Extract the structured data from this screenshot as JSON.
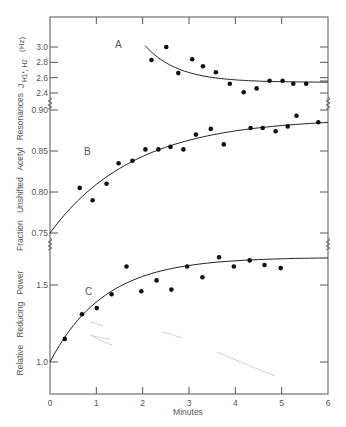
{
  "chart_data": [
    {
      "panel": "A",
      "type": "scatter",
      "title": "",
      "panel_label": "A",
      "xlabel": "Minutes",
      "ylabel": "J H1*,H2 (Hz)",
      "ylabel_parts": {
        "main": "J",
        "sub": "H1*, H2",
        "unit": "(Hz)"
      },
      "yticks": [
        3.0,
        2.8,
        2.6,
        2.4
      ],
      "ytick_labels": [
        "3.0",
        "2.8",
        "2.6",
        "2.4"
      ],
      "ylim": [
        2.3,
        3.2
      ],
      "x": [
        2.19,
        2.51,
        2.77,
        3.07,
        3.3,
        3.58,
        3.88,
        4.18,
        4.46,
        4.74,
        5.02,
        5.25,
        5.53
      ],
      "y": [
        2.83,
        3.0,
        2.66,
        2.84,
        2.75,
        2.67,
        2.52,
        2.41,
        2.46,
        2.56,
        2.56,
        2.52,
        2.52
      ],
      "fit_curve": {
        "type": "exponential-decay",
        "x_start": 2.05,
        "x_end": 6.0,
        "y_start": 3.02,
        "y_asymptote": 2.54
      }
    },
    {
      "panel": "B",
      "type": "scatter",
      "panel_label": "B",
      "xlabel": "Minutes",
      "ylabel": "Fraction Unshifted Acetyl Resonances",
      "yticks": [
        0.9,
        0.85,
        0.8,
        0.75
      ],
      "ytick_labels": [
        "0.90",
        "0.85",
        "0.80",
        "0.75"
      ],
      "ylim": [
        0.73,
        0.9
      ],
      "x": [
        0.64,
        0.92,
        1.22,
        1.48,
        1.78,
        2.06,
        2.34,
        2.6,
        2.88,
        3.15,
        3.47,
        3.75,
        4.33,
        4.59,
        4.87,
        5.13,
        5.32,
        5.79
      ],
      "y": [
        0.805,
        0.79,
        0.81,
        0.835,
        0.838,
        0.852,
        0.852,
        0.855,
        0.852,
        0.87,
        0.877,
        0.858,
        0.878,
        0.878,
        0.874,
        0.88,
        0.893,
        0.885
      ],
      "fit_curve": {
        "type": "exponential-rise",
        "x_start": 0.0,
        "x_end": 6.0,
        "y_start": 0.75,
        "y_asymptote": 0.89
      }
    },
    {
      "panel": "C",
      "type": "scatter",
      "panel_label": "C",
      "xlabel": "Minutes",
      "ylabel": "Relative Reducing Power",
      "yticks": [
        1.5,
        1.0
      ],
      "ytick_labels": [
        "1.5",
        "1.0"
      ],
      "ylim": [
        0.8,
        1.75
      ],
      "x": [
        0.32,
        0.69,
        1.01,
        1.33,
        1.65,
        1.97,
        2.3,
        2.62,
        2.96,
        3.29,
        3.65,
        3.97,
        4.31,
        4.63,
        4.98
      ],
      "y": [
        1.15,
        1.31,
        1.35,
        1.44,
        1.62,
        1.46,
        1.53,
        1.47,
        1.62,
        1.55,
        1.68,
        1.62,
        1.66,
        1.63,
        1.61
      ],
      "fit_curve": {
        "type": "exponential-rise",
        "x_start": 0.0,
        "x_end": 6.0,
        "y_start": 1.0,
        "y_asymptote": 1.68
      }
    }
  ],
  "x_axis": {
    "label": "Minutes",
    "ticks": [
      0,
      1,
      2,
      3,
      4,
      5,
      6
    ],
    "tick_labels": [
      "0",
      "1",
      "2",
      "3",
      "4",
      "5",
      "6"
    ],
    "xlim": [
      0,
      6
    ]
  },
  "labels": {
    "panel_a": "A",
    "panel_b": "B",
    "panel_c": "C",
    "ylabel_a_main": "J",
    "ylabel_a_sub": "H1*, H2",
    "ylabel_a_unit": "(Hz)",
    "ylabel_b": "Fraction   Unshifted   Acetyl   Resonances",
    "ylabel_c": "Relative   Reducing   Power",
    "xlabel": "Minutes"
  },
  "colors": {
    "axis": "#555555",
    "points": "#111111",
    "curve": "#222222",
    "pencil_marks": "#bbbbbb"
  }
}
